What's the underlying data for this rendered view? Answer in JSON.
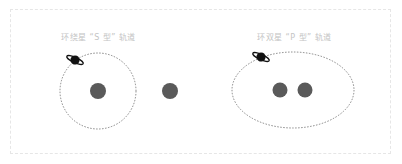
{
  "diagram": {
    "panels": [
      {
        "label": "环绕星 “S 型” 轨道",
        "orbit": {
          "shape": "circle",
          "cx": 98,
          "cy": 91,
          "r": 38
        },
        "stars": [
          {
            "cx": 98,
            "cy": 91,
            "r": 8
          },
          {
            "cx": 170,
            "cy": 91,
            "r": 8
          }
        ]
      },
      {
        "label": "环双星 “P 型” 轨道",
        "orbit": {
          "shape": "ellipse",
          "cx": 293,
          "cy": 90,
          "rx": 61,
          "ry": 38
        },
        "stars": [
          {
            "cx": 280,
            "cy": 90,
            "r": 7.5
          },
          {
            "cx": 305,
            "cy": 90,
            "r": 7.5
          }
        ]
      }
    ],
    "colors": {
      "star": "#5a5a5a",
      "planet": "#111111",
      "orbit": "#6a6a6a",
      "label": "#c4c4c4",
      "frame": "#e6e6e6"
    }
  }
}
